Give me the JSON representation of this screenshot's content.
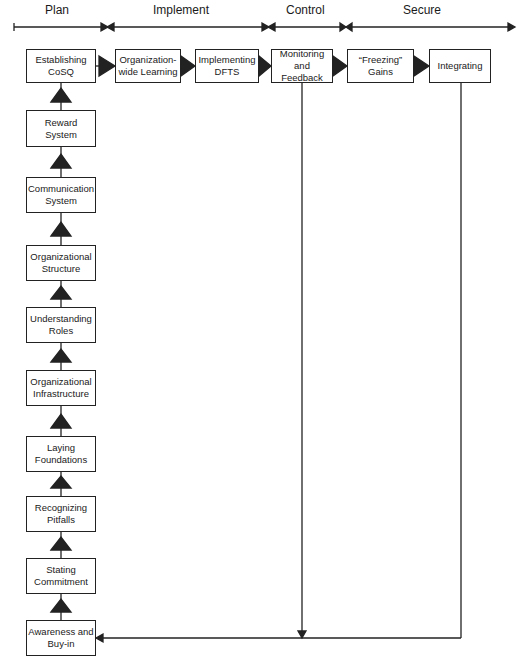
{
  "phases": [
    {
      "id": "plan",
      "label": "Plan"
    },
    {
      "id": "implement",
      "label": "Implement"
    },
    {
      "id": "control",
      "label": "Control"
    },
    {
      "id": "secure",
      "label": "Secure"
    }
  ],
  "top_row": [
    {
      "id": "establishing-cosq",
      "label": "Establishing\nCoSQ"
    },
    {
      "id": "organization-wide-learning",
      "label": "Organization-\nwide Learning"
    },
    {
      "id": "implementing-dfts",
      "label": "Implementing\nDFTS"
    },
    {
      "id": "monitoring-and-feedback",
      "label": "Monitoring\nand\nFeedback"
    },
    {
      "id": "freezing-gains",
      "label": "“Freezing”\nGains"
    },
    {
      "id": "integrating",
      "label": "Integrating"
    }
  ],
  "left_column": [
    {
      "id": "reward-system",
      "label": "Reward\nSystem"
    },
    {
      "id": "communication-system",
      "label": "Communication\nSystem"
    },
    {
      "id": "organizational-structure",
      "label": "Organizational\nStructure"
    },
    {
      "id": "understanding-roles",
      "label": "Understanding\nRoles"
    },
    {
      "id": "organizational-infrastructure",
      "label": "Organizational\nInfrastructure"
    },
    {
      "id": "laying-foundations",
      "label": "Laying\nFoundations"
    },
    {
      "id": "recognizing-pitfalls",
      "label": "Recognizing\nPitfalls"
    },
    {
      "id": "stating-commitment",
      "label": "Stating\nCommitment"
    },
    {
      "id": "awareness-and-buy-in",
      "label": "Awareness and\nBuy-in"
    }
  ],
  "colors": {
    "line": "#222222",
    "background": "#ffffff"
  }
}
